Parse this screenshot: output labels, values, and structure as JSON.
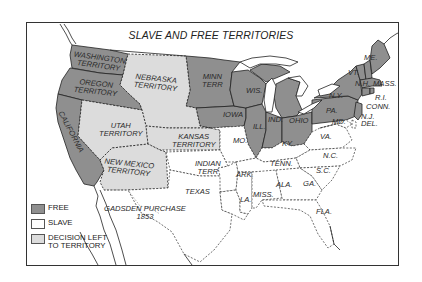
{
  "title": "SLAVE AND FREE TERRITORIES",
  "colors": {
    "free": "#8f8f8f",
    "slave": "#ffffff",
    "decision": "#dcdcdc",
    "border": "#222222",
    "frame": "#333333"
  },
  "legend": [
    {
      "key": "free",
      "label": "FREE"
    },
    {
      "key": "slave",
      "label": "SLAVE"
    },
    {
      "key": "decision",
      "label": "DECISION LEFT\nTO TERRITORY"
    }
  ],
  "regions": {
    "washington": "WASHINGTON\nTERRITORY",
    "oregon": "OREGON\nTERRITORY",
    "california": "CALIFORNIA",
    "nebraska": "NEBRASKA\nTERRITORY",
    "minnesota": "MINN\nTERR",
    "utah": "UTAH\nTERRITORY",
    "kansas": "KANSAS\nTERRITORY",
    "new_mexico": "NEW MEXICO\nTERRITORY",
    "indian": "INDIAN\nTERR",
    "texas": "TEXAS",
    "gadsden": "GADSDEN PURCHASE\n1853",
    "iowa": "IOWA",
    "wisconsin": "WIS.",
    "michigan": "MICH.",
    "illinois": "ILL.",
    "indiana": "IND.",
    "ohio": "OHIO",
    "missouri": "MO.",
    "kentucky": "KY.",
    "tennessee": "TENN.",
    "arkansas": "ARK.",
    "louisiana": "LA.",
    "mississippi": "MISS.",
    "alabama": "ALA.",
    "georgia": "GA.",
    "florida": "FLA.",
    "south_carolina": "S.C.",
    "north_carolina": "N.C.",
    "virginia": "VA.",
    "maryland": "MD.",
    "delaware": "DEL.",
    "new_jersey": "N.J.",
    "pennsylvania": "PA.",
    "new_york": "N.Y.",
    "connecticut": "CONN.",
    "rhode_island": "R.I.",
    "massachusetts": "MASS.",
    "vermont": "VT.",
    "new_hampshire": "N.H.",
    "maine": "ME."
  }
}
